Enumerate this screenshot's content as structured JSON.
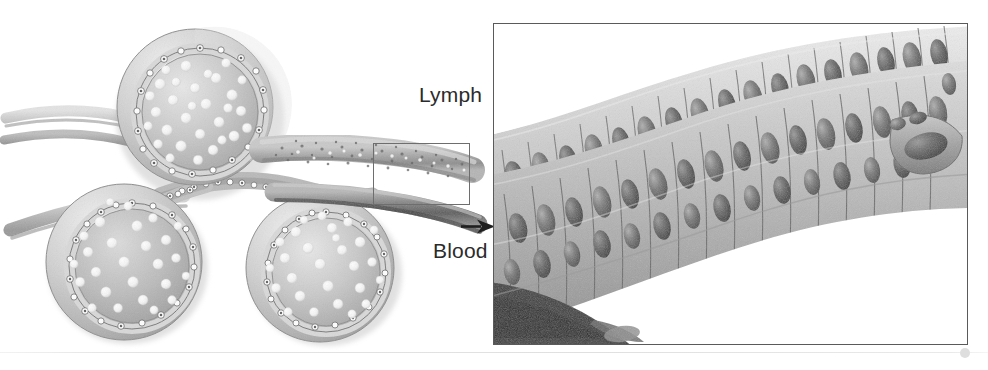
{
  "figure": {
    "kind": "anatomical-illustration",
    "background_color": "#ffffff",
    "ink_color": "#2b2b2b"
  },
  "labels": {
    "lymph": "Lymph",
    "blood": "Blood"
  },
  "left_illustration": {
    "name": "alveoli-capillary-cluster",
    "description": "Three cut-open spherical follicle structures with pale interiors containing white granule dots, ringed by a border of small cells, joined at a central junction and connected to tubular vessels extending left and right",
    "spheres": [
      {
        "id": "sphere-top",
        "cx": 195,
        "cy": 107,
        "r": 77,
        "dots": 30
      },
      {
        "id": "sphere-lower-left",
        "cx": 124,
        "cy": 261,
        "r": 76,
        "dots": 26
      },
      {
        "id": "sphere-lower-right",
        "cx": 320,
        "cy": 268,
        "r": 72,
        "dots": 27
      }
    ],
    "vessels": [
      {
        "id": "lymph-vessel",
        "label_ref": "lymph",
        "direction": "right",
        "texture": "granular"
      },
      {
        "id": "blood-vessel",
        "label_ref": "blood",
        "direction": "right",
        "texture": "smooth-dark"
      },
      {
        "id": "afferent-vessels",
        "direction": "left",
        "count": 2
      }
    ]
  },
  "callout": {
    "name": "magnification-region",
    "x": 373,
    "y": 143,
    "width": 97,
    "height": 62,
    "stroke_color": "#6e6e6e"
  },
  "pointer": {
    "name": "blood-pointer-arrow",
    "direction": "right",
    "color": "#1f1f1f"
  },
  "detail_panel": {
    "name": "magnified-vessel-wall",
    "x": 493,
    "y": 23,
    "width": 475,
    "height": 322,
    "border_color": "#5a5a5a",
    "description": "High magnification drawing of the vessel wall running diagonally from lower-left to upper-right, composed of rows of elongated epithelial cells each containing a dark oval nucleus, with pale cytoplasm and darker intercellular boundaries"
  },
  "divider": {
    "name": "page-divider",
    "y": 352,
    "color": "#e2e2e2"
  },
  "corner_marker": {
    "name": "page-corner-dot",
    "color": "#dedede"
  }
}
